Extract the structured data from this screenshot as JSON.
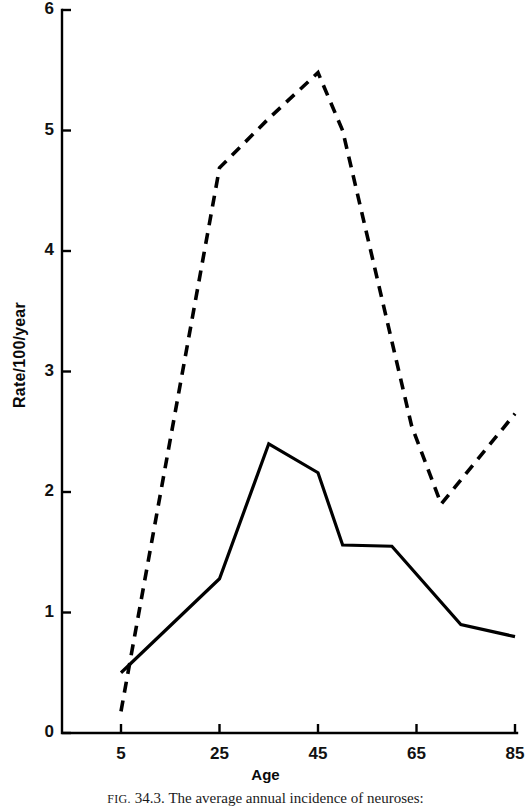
{
  "figure": {
    "caption_prefix": "FIG.",
    "caption_number": "34.3.",
    "caption_text": "The average annual incidence of neuroses:"
  },
  "chart_data": {
    "type": "line",
    "title": "",
    "xlabel": "Age",
    "ylabel": "Rate/100/year",
    "xlim": [
      5,
      85
    ],
    "ylim": [
      0,
      6
    ],
    "xticks": [
      5,
      25,
      45,
      65,
      85
    ],
    "xtick_labels": [
      "5",
      "25",
      "45",
      "65",
      "85"
    ],
    "yticks": [
      0,
      1,
      2,
      3,
      4,
      5,
      6
    ],
    "ytick_labels": [
      "0",
      "1",
      "2",
      "3",
      "4",
      "5",
      "6"
    ],
    "grid": false,
    "legend": "none",
    "series": [
      {
        "name": "solid-series",
        "style": "solid",
        "color": "#000000",
        "x": [
          5,
          25,
          35,
          45,
          50,
          60,
          74,
          85
        ],
        "values": [
          0.5,
          1.28,
          2.4,
          2.16,
          1.56,
          1.55,
          0.9,
          0.8
        ]
      },
      {
        "name": "dashed-series",
        "style": "dashed",
        "color": "#000000",
        "x": [
          5,
          25,
          35,
          45,
          50,
          64,
          70,
          85
        ],
        "values": [
          0.18,
          4.69,
          5.1,
          5.48,
          5.0,
          2.55,
          1.9,
          2.65
        ]
      }
    ]
  },
  "axis_style": {
    "line_color": "#000000",
    "tick_length": 9,
    "axis_width": 2.4
  }
}
